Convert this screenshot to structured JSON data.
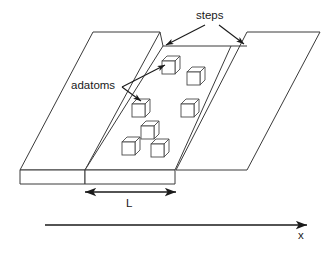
{
  "figure": {
    "kind": "schematic-diagram",
    "background_color": "#ffffff",
    "line_color": "#3a3a3a",
    "annotation_color": "#1a1a1a"
  },
  "labels": {
    "steps": "steps",
    "adatoms": "adatoms",
    "terrace_width": "L",
    "axis": "x"
  },
  "geometry": {
    "terraces": [
      {
        "name": "left-terrace",
        "points": "93,32 160,32 85,170 20,170"
      },
      {
        "name": "middle-terrace",
        "points": "163,46 231,46 175,170 85,170"
      },
      {
        "name": "right-terrace",
        "points": "247,32 320,32 247,170 176,170"
      }
    ],
    "risers": [
      {
        "name": "left-step-riser",
        "points": "20,170 85,170 85,184 20,184"
      },
      {
        "name": "middle-step-riser",
        "points": "85,170 175,170 175,184 85,184"
      }
    ],
    "step_edges": [
      {
        "name": "upper-step-edge",
        "d": "M160,32 L163,46"
      },
      {
        "name": "lower-step-edge",
        "d": "M231,46 L247,46"
      }
    ],
    "cubes": [
      {
        "name": "adatom-1",
        "x": 162,
        "y": 61
      },
      {
        "name": "adatom-2",
        "x": 187,
        "y": 72
      },
      {
        "name": "adatom-3",
        "x": 132,
        "y": 104
      },
      {
        "name": "adatom-4",
        "x": 181,
        "y": 104
      },
      {
        "name": "adatom-5",
        "x": 141,
        "y": 126
      },
      {
        "name": "adatom-6",
        "x": 122,
        "y": 142
      },
      {
        "name": "adatom-7",
        "x": 151,
        "y": 144
      }
    ],
    "cube_size": 13,
    "cube_depth": 5,
    "leaders": {
      "steps_left": "M205,25 L166,45",
      "steps_right": "M219,25 L244,44",
      "adatoms_up": "M122,87 L165,65",
      "adatoms_down": "M122,87 L141,101"
    },
    "dimension_arrow": {
      "x1": 85,
      "x2": 176,
      "y": 192
    },
    "axis_arrow": {
      "x1": 45,
      "x2": 307,
      "y": 225
    }
  }
}
